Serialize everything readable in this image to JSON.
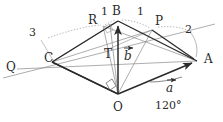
{
  "figure": {
    "kind": "vector-geometry-diagram",
    "width": 223,
    "height": 122,
    "background_color": "#ffffff",
    "stroke_color": "#2b2b2b",
    "thin_stroke_color": "#8a8a8a",
    "points": {
      "O": {
        "label": "O",
        "x": 118,
        "y": 94
      },
      "A": {
        "label": "A",
        "x": 197,
        "y": 61
      },
      "B": {
        "label": "B",
        "x": 118,
        "y": 21
      },
      "C": {
        "label": "C",
        "x": 52,
        "y": 62
      },
      "P": {
        "label": "P",
        "x": 152,
        "y": 30
      },
      "R": {
        "label": "R",
        "x": 103,
        "y": 26
      },
      "T": {
        "label": "T",
        "x": 104,
        "y": 51
      },
      "Q": {
        "label": "Q",
        "x": 17,
        "y": 69
      }
    },
    "labels": {
      "O": "O",
      "A": "A",
      "B": "B",
      "C": "C",
      "P": "P",
      "R": "R",
      "T": "T",
      "Q": "Q",
      "seg_RB": "1",
      "seg_BP": "1",
      "arc_CR": "3",
      "arc_PA": "2",
      "vec_a": "a",
      "vec_b": "b",
      "angle_AOa": "120°"
    }
  }
}
